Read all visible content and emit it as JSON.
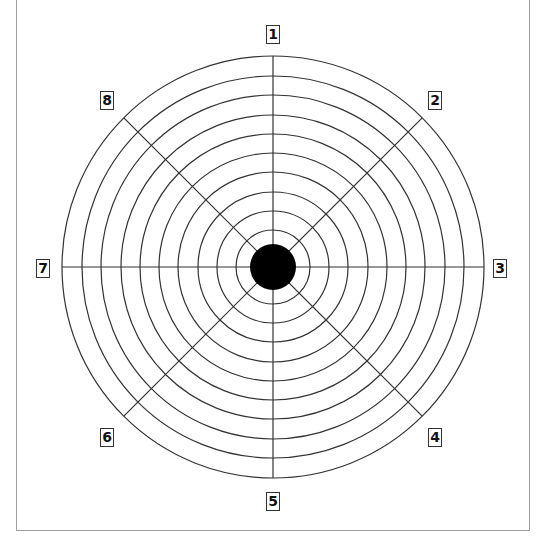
{
  "diagram": {
    "type": "radial-target",
    "center": {
      "x": 273,
      "y": 267
    },
    "bullseye_radius": 23,
    "ring_radii": [
      37,
      56,
      75,
      95,
      114,
      133,
      152,
      172,
      191,
      211
    ],
    "spoke_count": 8,
    "line_color": "#333333",
    "bullseye_color": "#000000",
    "frame_color": "#a0a0a0"
  },
  "labels": [
    {
      "text": "1",
      "x": 266,
      "y": 25
    },
    {
      "text": "2",
      "x": 428,
      "y": 91
    },
    {
      "text": "3",
      "x": 493,
      "y": 259
    },
    {
      "text": "4",
      "x": 428,
      "y": 428
    },
    {
      "text": "5",
      "x": 266,
      "y": 492
    },
    {
      "text": "6",
      "x": 100,
      "y": 428
    },
    {
      "text": "7",
      "x": 36,
      "y": 259
    },
    {
      "text": "8",
      "x": 100,
      "y": 91
    }
  ]
}
